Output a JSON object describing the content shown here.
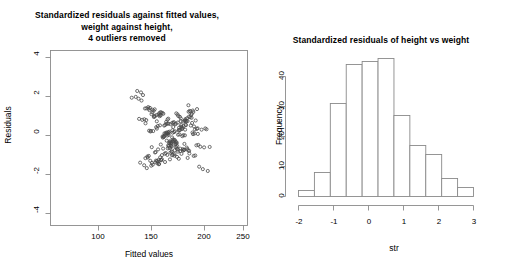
{
  "figure": {
    "background": "#ffffff",
    "foreground": "#000000",
    "axis_color": "#8a8a8a",
    "point_color": "#4a4a4a"
  },
  "panels": {
    "scatter": {
      "title": "Standardized residuals against fitted values,\nweight against height,\n4 outliers removed",
      "xlabel": "Fitted values",
      "ylabel": "Residuals",
      "xticks": [
        "100",
        "150",
        "200",
        "250"
      ],
      "yticks": [
        "-4",
        "-2",
        "0",
        "2",
        "4"
      ]
    },
    "hist": {
      "title": "Standardized residuals of height vs weight",
      "xlabel": "str",
      "ylabel": "Frequency",
      "xticks": [
        "-2",
        "-1",
        "0",
        "1",
        "2",
        "3"
      ],
      "yticks": [
        "0",
        "10",
        "20",
        "30",
        "40"
      ]
    }
  },
  "chart_data": [
    {
      "type": "scatter",
      "title": "Standardized residuals against fitted values, weight against height, 4 outliers removed",
      "xlabel": "Fitted values",
      "ylabel": "Residuals",
      "xlim": [
        75,
        262
      ],
      "ylim": [
        -4.3,
        4.3
      ],
      "xticks": [
        100,
        150,
        200,
        250
      ],
      "yticks": [
        -4,
        -2,
        0,
        2,
        4
      ],
      "grid": false,
      "legend": null,
      "marker": "open-circle",
      "n_points": 240,
      "x": [
        185.9,
        171.1,
        198.6,
        160.1,
        206.4,
        179.7,
        191.5,
        214.1,
        168.3,
        183.2,
        196.0,
        175.6,
        202.8,
        188.4,
        165.2,
        193.7,
        210.6,
        177.1,
        186.8,
        199.3,
        172.5,
        205.9,
        190.2,
        181.4,
        163.9,
        208.2,
        195.1,
        178.3,
        187.6,
        200.4,
        169.7,
        212.8,
        184.1,
        174.2,
        197.8,
        189.5,
        203.6,
        166.4,
        192.3,
        180.8,
        207.1,
        176.0,
        194.6,
        186.1,
        201.7,
        170.9,
        213.5,
        182.6,
        196.8,
        188.9,
        164.7,
        204.3,
        191.0,
        179.1,
        209.4,
        185.3,
        173.4,
        198.1,
        190.7,
        202.1,
        167.8,
        211.2,
        183.7,
        175.9,
        195.4,
        187.2,
        206.8,
        171.6,
        193.1,
        181.9,
        208.9,
        177.7,
        199.8,
        189.1,
        162.8,
        203.2,
        192.6,
        178.8,
        186.4,
        200.9,
        168.9,
        215.3,
        184.8,
        176.6,
        197.1,
        190.4,
        205.2,
        165.9,
        194.2,
        182.1,
        209.8,
        174.8,
        198.7,
        188.1,
        201.3,
        172.1,
        212.1,
        185.9,
        196.3,
        187.8,
        161.4,
        204.9,
        191.8,
        180.2,
        210.3,
        186.6,
        173.9,
        199.1,
        189.8,
        202.7,
        166.9,
        214.6,
        183.1,
        177.2,
        195.9,
        188.6,
        207.6,
        170.3,
        192.8,
        181.3,
        216.1,
        175.3,
        200.1,
        190.1,
        160.9,
        203.8,
        193.4,
        179.6,
        187.1,
        201.9,
        169.4,
        217.2,
        185.1,
        176.1,
        196.6,
        191.2,
        206.1,
        164.1,
        194.9,
        182.9,
        210.9,
        174.1,
        197.4,
        189.4,
        202.4,
        171.3,
        213.9,
        184.4,
        195.6,
        186.9,
        158.6,
        205.6,
        192.1,
        180.7,
        211.7,
        187.4,
        172.9,
        198.9,
        190.9,
        203.1,
        167.3,
        218.4,
        182.4,
        178.1,
        194.1,
        187.9,
        208.4,
        169.9,
        191.3,
        180.1,
        219.6,
        176.9,
        201.1,
        189.9,
        157.3,
        204.1,
        193.9,
        178.6,
        185.6,
        200.6,
        168.1,
        220.8,
        186.1,
        175.1,
        197.9,
        192.4,
        207.9,
        162.1,
        195.8,
        183.9,
        212.4,
        173.1,
        196.1,
        188.4,
        201.1,
        170.6,
        221.9,
        183.4,
        194.4,
        185.1,
        155.9,
        206.6,
        190.6,
        179.9,
        214.9,
        188.8,
        171.9,
        199.6,
        191.6,
        204.6,
        165.1,
        223.1,
        181.6,
        177.9,
        193.3,
        186.3,
        209.1,
        168.6,
        190.3,
        179.4,
        224.3,
        178.9,
        202.6,
        188.8,
        152.1,
        205.1,
        194.8,
        177.4,
        184.3,
        198.4,
        166.1,
        226.1,
        187.1,
        174.6,
        196.9,
        193.1,
        210.1,
        159.1,
        192.9
      ],
      "y": [
        0.12,
        -0.45,
        0.83,
        -1.21,
        1.05,
        -0.32,
        0.54,
        1.42,
        -0.88,
        0.23,
        -0.67,
        1.13,
        0.41,
        -1.05,
        0.72,
        -0.19,
        1.28,
        -0.56,
        0.95,
        -0.78,
        0.34,
        1.61,
        -0.42,
        0.08,
        -1.34,
        0.61,
        -0.93,
        1.22,
        -0.25,
        0.49,
        -1.12,
        0.86,
        0.17,
        -0.71,
        1.04,
        -0.38,
        0.63,
        -1.48,
        0.29,
        -0.84,
        1.33,
        0.46,
        -0.21,
        0.91,
        -0.59,
        1.17,
        -0.36,
        0.05,
        -1.02,
        0.68,
        1.45,
        -0.47,
        0.26,
        -0.95,
        0.74,
        -0.13,
        1.09,
        -0.64,
        0.38,
        -0.29,
        1.52,
        0.57,
        -1.18,
        0.82,
        -0.41,
        0.15,
        -0.76,
        1.26,
        0.33,
        -0.52,
        0.99,
        -1.07,
        0.44,
        -0.18,
        2.11,
        0.66,
        -0.87,
        1.14,
        0.21,
        -0.62,
        1.37,
        -0.34,
        0.79,
        -1.25,
        0.51,
        0.03,
        -0.98,
        0.88,
        -0.45,
        1.19,
        0.27,
        -0.69,
        0.96,
        -0.16,
        0.58,
        -1.31,
        0.42,
        -0.83,
        1.08,
        0.31,
        1.84,
        -0.54,
        0.73,
        -1.09,
        0.19,
        -0.37,
        1.41,
        0.64,
        -0.24,
        0.87,
        -0.91,
        0.48,
        0.11,
        -1.16,
        0.76,
        -0.48,
        1.02,
        0.35,
        -0.79,
        1.23,
        -1.41,
        0.53,
        0.09,
        -0.66,
        2.24,
        0.81,
        -0.31,
        1.11,
        0.25,
        -0.58,
        1.48,
        -0.43,
        0.69,
        -1.13,
        0.37,
        -0.07,
        1.29,
        0.92,
        -0.52,
        0.61,
        -0.88,
        1.06,
        0.18,
        -0.26,
        0.84,
        -1.22,
        0.45,
        -0.74,
        1.16,
        0.29,
        1.93,
        -0.61,
        0.78,
        -1.04,
        0.22,
        -0.39,
        1.34,
        0.56,
        -0.17,
        0.93,
        -0.96,
        0.41,
        0.06,
        -1.27,
        0.71,
        -0.49,
        1.12,
        0.32,
        -0.82,
        1.25,
        -1.53,
        0.59,
        0.14,
        -0.68,
        2.31,
        0.85,
        -0.28,
        1.07,
        0.24,
        -0.55,
        1.44,
        -0.46,
        0.72,
        -1.11,
        0.39,
        -0.09,
        1.31,
        0.89,
        -0.57,
        0.64,
        -0.86,
        1.03,
        0.16,
        -0.23,
        0.81,
        -1.36,
        0.47,
        -0.77,
        1.21,
        0.27,
        2.02,
        -0.63,
        0.75,
        -1.08,
        0.2,
        -0.35,
        1.39,
        0.52,
        -0.14,
        0.97,
        -0.99,
        0.43,
        0.02,
        -1.29,
        0.67,
        -0.51,
        1.18,
        0.36,
        -0.85,
        1.27,
        -1.62,
        0.62,
        0.13,
        -0.72,
        1.98,
        0.83,
        -0.27,
        1.15,
        0.23,
        -0.53,
        1.46,
        -0.44,
        0.7,
        -1.19,
        0.4,
        -0.11,
        1.35,
        0.94,
        -0.6,
        0.65,
        -0.89,
        1.01,
        -2.06,
        -2.31,
        -1.92,
        -2.48,
        1.75,
        -1.83,
        -2.18,
        1.68,
        -2.64
      ]
    },
    {
      "type": "bar",
      "subtype": "histogram",
      "title": "Standardized residuals of height vs weight",
      "xlabel": "str",
      "ylabel": "Frequency",
      "xlim": [
        -2.5,
        3.0
      ],
      "ylim": [
        0,
        46
      ],
      "xticks": [
        -2,
        -1,
        0,
        1,
        2,
        3
      ],
      "yticks": [
        0,
        10,
        20,
        30,
        40
      ],
      "grid": false,
      "legend": null,
      "bin_width": 0.5,
      "bin_edges": [
        -2.5,
        -2.0,
        -1.5,
        -1.0,
        -0.5,
        0.0,
        0.5,
        1.0,
        1.5,
        2.0,
        2.5,
        3.0
      ],
      "categories": [
        "-2.5 to -2.0",
        "-2.0 to -1.5",
        "-1.5 to -1.0",
        "-1.0 to -0.5",
        "-0.5 to 0.0",
        "0.0 to 0.5",
        "0.5 to 1.0",
        "1.0 to 1.5",
        "1.5 to 2.0",
        "2.0 to 2.5",
        "2.5 to 3.0"
      ],
      "values": [
        2,
        8,
        31,
        44,
        45,
        46,
        27,
        17,
        14,
        6,
        3
      ]
    }
  ]
}
